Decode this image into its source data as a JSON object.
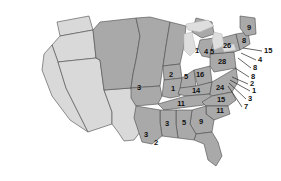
{
  "figure": {
    "kind": "choropleth-map",
    "region": "United States",
    "colors": {
      "shaded_state": "#a9a9a9",
      "unshaded_state": "#d9d9d9",
      "water": "#ffffff",
      "lakes": "#dedede",
      "border": "#4a4a4a",
      "label_text": "#111111",
      "leader_line": "#222222"
    }
  },
  "chart_data": {
    "type": "map",
    "title": "",
    "xlabel": "",
    "ylabel": "",
    "value_label": "",
    "legend": [],
    "categories": [
      "Missouri",
      "Iowa",
      "Illinois",
      "Indiana",
      "Ohio",
      "Kentucky",
      "Tennessee",
      "Pennsylvania",
      "Virginia",
      "North Carolina",
      "South Carolina",
      "Georgia",
      "Alabama",
      "Mississippi",
      "Louisiana",
      "Florida-gulf-marker",
      "Michigan",
      "Michigan-2",
      "Michigan-3",
      "New York",
      "New England-north",
      "Maine",
      "New Jersey",
      "Delaware",
      "Maryland",
      "West-Virginia-area",
      "Connecticut",
      "Rhode Island",
      "Massachusetts",
      "Vermont-NH"
    ],
    "values": [
      3,
      2,
      1,
      5,
      16,
      14,
      11,
      28,
      24,
      15,
      11,
      9,
      5,
      3,
      3,
      2,
      1,
      4,
      5,
      26,
      8,
      9,
      15,
      4,
      8,
      8,
      2,
      1,
      3,
      7
    ]
  },
  "map_labels": [
    {
      "id": "label-missouri",
      "text": "3",
      "x": 139,
      "y": 88
    },
    {
      "id": "label-iowa",
      "text": "2",
      "x": 171,
      "y": 75
    },
    {
      "id": "label-illinois",
      "text": "1",
      "x": 173,
      "y": 89
    },
    {
      "id": "label-indiana",
      "text": "5",
      "x": 186,
      "y": 77
    },
    {
      "id": "label-ohio",
      "text": "16",
      "x": 200,
      "y": 75
    },
    {
      "id": "label-kentucky",
      "text": "14",
      "x": 196,
      "y": 91
    },
    {
      "id": "label-tennessee",
      "text": "11",
      "x": 181,
      "y": 104
    },
    {
      "id": "label-pennsylvania",
      "text": "28",
      "x": 222,
      "y": 62
    },
    {
      "id": "label-virginia",
      "text": "24",
      "x": 220,
      "y": 88
    },
    {
      "id": "label-north-carolina",
      "text": "15",
      "x": 221,
      "y": 100
    },
    {
      "id": "label-south-carolina",
      "text": "11",
      "x": 220,
      "y": 111
    },
    {
      "id": "label-georgia",
      "text": "9",
      "x": 201,
      "y": 122
    },
    {
      "id": "label-alabama",
      "text": "5",
      "x": 184,
      "y": 123
    },
    {
      "id": "label-mississippi",
      "text": "3",
      "x": 167,
      "y": 124
    },
    {
      "id": "label-louisiana",
      "text": "3",
      "x": 146,
      "y": 135
    },
    {
      "id": "label-gulf-marker",
      "text": "2",
      "x": 156,
      "y": 143
    },
    {
      "id": "label-michigan-1",
      "text": "1",
      "x": 197,
      "y": 51
    },
    {
      "id": "label-michigan-2",
      "text": "4",
      "x": 206,
      "y": 52
    },
    {
      "id": "label-michigan-3",
      "text": "5",
      "x": 212,
      "y": 52
    },
    {
      "id": "label-new-york",
      "text": "26",
      "x": 227,
      "y": 46
    },
    {
      "id": "label-new-england",
      "text": "8",
      "x": 244,
      "y": 41
    },
    {
      "id": "label-maine",
      "text": "9",
      "x": 249,
      "y": 28
    }
  ],
  "leader_labels": [
    {
      "id": "leader-1",
      "text": "15",
      "x": 264,
      "y": 51,
      "ax": 262,
      "ay": 51,
      "bx": 243,
      "by": 48
    },
    {
      "id": "leader-2",
      "text": "4",
      "x": 258,
      "y": 60,
      "ax": 256,
      "ay": 60,
      "bx": 241,
      "by": 53
    },
    {
      "id": "leader-3",
      "text": "8",
      "x": 253,
      "y": 68,
      "ax": 251,
      "ay": 68,
      "bx": 238,
      "by": 58
    },
    {
      "id": "leader-4",
      "text": "8",
      "x": 251,
      "y": 77,
      "ax": 249,
      "ay": 77,
      "bx": 235,
      "by": 68
    },
    {
      "id": "leader-5",
      "text": "2",
      "x": 250,
      "y": 84,
      "ax": 248,
      "ay": 84,
      "bx": 232,
      "by": 77
    },
    {
      "id": "leader-6",
      "text": "1",
      "x": 252,
      "y": 91,
      "ax": 250,
      "ay": 91,
      "bx": 230,
      "by": 80
    },
    {
      "id": "leader-7",
      "text": "3",
      "x": 248,
      "y": 99,
      "ax": 246,
      "ay": 99,
      "bx": 229,
      "by": 83
    },
    {
      "id": "leader-8",
      "text": "7",
      "x": 244,
      "y": 107,
      "ax": 242,
      "ay": 107,
      "bx": 228,
      "by": 86
    }
  ]
}
